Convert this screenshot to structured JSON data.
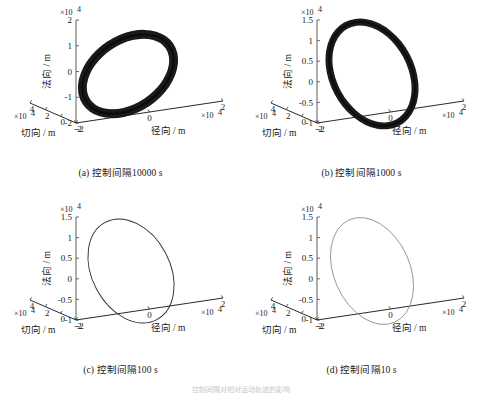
{
  "figure": {
    "panel_count": 4,
    "bottom_partial_text": "控制间隔对相对运动轨迹的影响"
  },
  "axis_labels": {
    "vertical": "法向 / m",
    "left_floor": "切向 / m",
    "right_floor": "径向 / m",
    "exponent": "×10",
    "exponent_power": "4"
  },
  "panels": [
    {
      "id": "a",
      "caption": "(a) 控制间隔10000 s",
      "z_ticks": [
        "2",
        "1",
        "0",
        "-1",
        "-2"
      ],
      "z_values": [
        2,
        1,
        0,
        -1,
        -2
      ],
      "x_ticks": [
        "4",
        "2",
        "0",
        "-2"
      ],
      "x_values": [
        4,
        2,
        0,
        -2
      ],
      "y_ticks": [
        "-2",
        "0",
        "2"
      ],
      "y_values": [
        -2,
        0,
        2
      ],
      "ring": {
        "style": "thick-filled-annulus",
        "stroke_color": "#1a1a1a",
        "band_width": 9,
        "tilt_deg": -34,
        "rx": 50,
        "ry": 34,
        "cx": 128,
        "cy": 74
      }
    },
    {
      "id": "b",
      "caption": "(b) 控制间隔1000 s",
      "z_ticks": [
        "1.5",
        "1",
        "0.5",
        "0",
        "-0.5",
        "-1"
      ],
      "z_values": [
        1.5,
        1,
        0.5,
        0,
        -0.5,
        -1
      ],
      "x_ticks": [
        "4",
        "2",
        "0",
        "-2"
      ],
      "x_values": [
        4,
        2,
        0,
        -2
      ],
      "y_ticks": [
        "-2",
        "0",
        "2"
      ],
      "y_values": [
        -2,
        0,
        2
      ],
      "ring": {
        "style": "thick-filled-annulus",
        "stroke_color": "#1a1a1a",
        "band_width": 7,
        "tilt_deg": -28,
        "rx": 39,
        "ry": 55,
        "cx": 131,
        "cy": 74
      }
    },
    {
      "id": "c",
      "caption": "(c) 控制间隔100 s",
      "z_ticks": [
        "1.5",
        "1",
        "0.5",
        "0",
        "-0.5",
        "-1"
      ],
      "z_values": [
        1.5,
        1,
        0.5,
        0,
        -0.5,
        -1
      ],
      "x_ticks": [
        "4",
        "2",
        "0",
        "-2"
      ],
      "x_values": [
        4,
        2,
        0,
        -2
      ],
      "y_ticks": [
        "-2",
        "0",
        "2"
      ],
      "y_values": [
        -2,
        0,
        2
      ],
      "ring": {
        "style": "thin-outline",
        "stroke_color": "#2b2b2b",
        "band_width": 0.9,
        "tilt_deg": -28,
        "rx": 39,
        "ry": 55,
        "cx": 131,
        "cy": 74
      }
    },
    {
      "id": "d",
      "caption": "(d) 控制间隔10 s",
      "z_ticks": [
        "1.5",
        "1",
        "0.5",
        "0",
        "-0.5",
        "-1"
      ],
      "z_values": [
        1.5,
        1,
        0.5,
        0,
        -0.5,
        -1
      ],
      "x_ticks": [
        "4",
        "2",
        "0",
        "-2"
      ],
      "x_values": [
        4,
        2,
        0,
        -2
      ],
      "y_ticks": [
        "-2",
        "0",
        "2"
      ],
      "y_values": [
        -2,
        0,
        2
      ],
      "ring": {
        "style": "thin-outline",
        "stroke_color": "#8a8a8a",
        "band_width": 0.8,
        "tilt_deg": -24,
        "rx": 38,
        "ry": 56,
        "cx": 131,
        "cy": 74
      }
    }
  ],
  "chart_data": {
    "type": "line",
    "title": "",
    "subplots": [
      {
        "label": "(a) 控制间隔10000 s",
        "control_interval_s": 10000,
        "xlabel": "切向 / m",
        "ylabel": "径向 / m",
        "zlabel": "法向 / m",
        "zlim": [
          -2,
          2
        ],
        "z_scale": 10000,
        "xlim": [
          -2,
          4
        ],
        "x_scale": 10000,
        "ylim": [
          -2,
          2
        ],
        "y_scale": 10000,
        "trajectory": "drifting elliptical relative orbit; many revolutions sweep a thick annular band (widest drift spread of the four cases)",
        "band_thickness_rel": 1.0,
        "grid": false,
        "legend": "none"
      },
      {
        "label": "(b) 控制间隔1000 s",
        "control_interval_s": 1000,
        "xlabel": "切向 / m",
        "ylabel": "径向 / m",
        "zlabel": "法向 / m",
        "zlim": [
          -1,
          1.5
        ],
        "z_scale": 10000,
        "xlim": [
          -2,
          4
        ],
        "x_scale": 10000,
        "ylim": [
          -2,
          2
        ],
        "y_scale": 10000,
        "trajectory": "elliptical relative orbit with moderate drift forming a narrower filled band",
        "band_thickness_rel": 0.75,
        "grid": false,
        "legend": "none"
      },
      {
        "label": "(c) 控制间隔100 s",
        "control_interval_s": 100,
        "xlabel": "切向 / m",
        "ylabel": "径向 / m",
        "zlabel": "法向 / m",
        "zlim": [
          -1,
          1.5
        ],
        "z_scale": 10000,
        "xlim": [
          -2,
          4
        ],
        "x_scale": 10000,
        "ylim": [
          -2,
          2
        ],
        "y_scale": 10000,
        "trajectory": "nearly closed single ellipse, negligible drift",
        "band_thickness_rel": 0.06,
        "grid": false,
        "legend": "none"
      },
      {
        "label": "(d) 控制间隔10 s",
        "control_interval_s": 10,
        "xlabel": "切向 / m",
        "ylabel": "径向 / m",
        "zlabel": "法向 / m",
        "zlim": [
          -1,
          1.5
        ],
        "z_scale": 10000,
        "xlim": [
          -2,
          4
        ],
        "x_scale": 10000,
        "ylim": [
          -2,
          2
        ],
        "y_scale": 10000,
        "trajectory": "closed single ellipse, trajectory repeats exactly",
        "band_thickness_rel": 0.04,
        "grid": false,
        "legend": "none"
      }
    ]
  }
}
